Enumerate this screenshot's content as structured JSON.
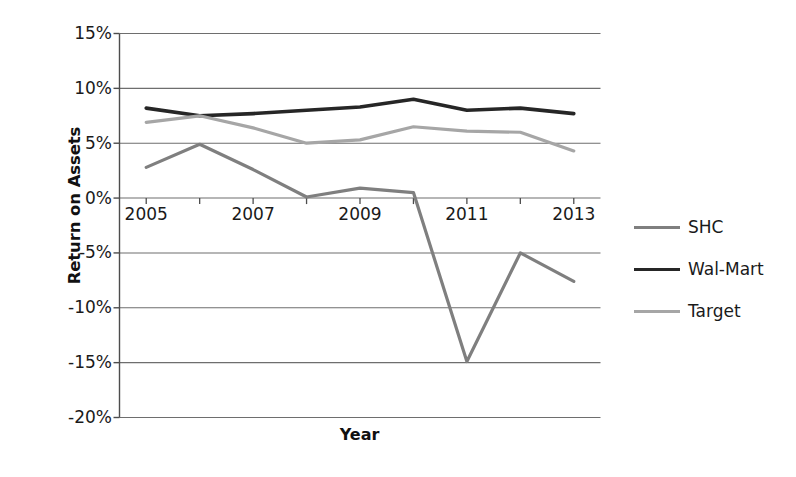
{
  "chart_data": {
    "type": "line",
    "title": "",
    "xlabel": "Year",
    "ylabel": "Return on Assets",
    "x": [
      2005,
      2006,
      2007,
      2008,
      2009,
      2010,
      2011,
      2012,
      2013
    ],
    "xlim": [
      2004.5,
      2013.5
    ],
    "ylim": [
      -20,
      15
    ],
    "ytick_values": [
      15,
      10,
      5,
      0,
      -5,
      -10,
      -15,
      -20
    ],
    "ytick_labels": [
      "15%",
      "10%",
      "5%",
      "0%",
      "-5%",
      "-10%",
      "-15%",
      "-20%"
    ],
    "xtick_values": [
      2005,
      2006,
      2007,
      2008,
      2009,
      2010,
      2011,
      2012,
      2013
    ],
    "xtick_labels": [
      "2005",
      "",
      "2007",
      "",
      "2009",
      "",
      "2011",
      "",
      "2013"
    ],
    "grid": true,
    "grid_axis": "y",
    "legend_position": "right",
    "series": [
      {
        "name": "SHC",
        "color": "#7f7f7f",
        "width": 3.2,
        "values": [
          2.8,
          4.9,
          2.6,
          0.1,
          0.9,
          0.5,
          -14.9,
          -5.0,
          -7.6
        ]
      },
      {
        "name": "Wal-Mart",
        "color": "#262626",
        "width": 3.6,
        "values": [
          8.2,
          7.5,
          7.7,
          8.0,
          8.3,
          9.0,
          8.0,
          8.2,
          7.7
        ]
      },
      {
        "name": "Target",
        "color": "#a6a6a6",
        "width": 3.2,
        "values": [
          6.9,
          7.5,
          6.4,
          5.0,
          5.3,
          6.5,
          6.1,
          6.0,
          4.3
        ]
      }
    ]
  },
  "legend": {
    "items": [
      {
        "label": "SHC"
      },
      {
        "label": "Wal-Mart"
      },
      {
        "label": "Target"
      }
    ]
  },
  "axes": {
    "y_title": "Return on Assets",
    "x_title": "Year"
  },
  "colors": {
    "shc": "#7f7f7f",
    "walmart": "#262626",
    "target": "#a6a6a6",
    "grid": "#6e6e6e",
    "axis": "#4d4d4d",
    "background": "#ffffff",
    "text": "#1a1a1a"
  }
}
